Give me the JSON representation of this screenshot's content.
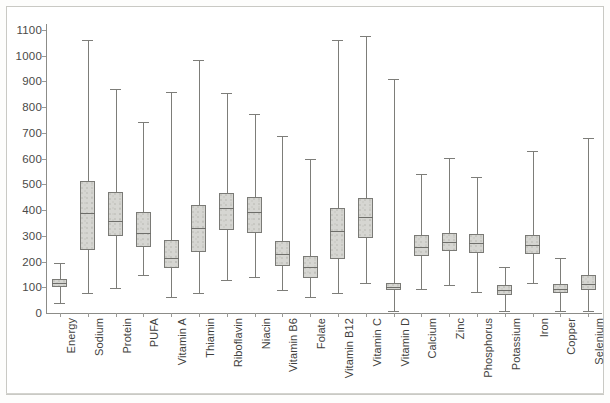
{
  "chart_data": {
    "type": "box",
    "title": "",
    "subtitle": "",
    "xlabel": "",
    "ylabel": "",
    "ylim": [
      0,
      1100
    ],
    "ytick_step": 100,
    "yticks": [
      0,
      100,
      200,
      300,
      400,
      500,
      600,
      700,
      800,
      900,
      1000,
      1100
    ],
    "ytick_labels": [
      "0",
      "100",
      "200",
      "300",
      "400",
      "500",
      "600",
      "700",
      "800",
      "900",
      "1000",
      "1100"
    ],
    "grid": false,
    "legend": null,
    "orientation": "vertical",
    "categories": [
      "Energy",
      "Sodium",
      "Protein",
      "PUFA",
      "Vitamin A",
      "Thiamin",
      "Riboflavin",
      "Niacin",
      "Vitamin B6",
      "Folate",
      "Vitamin B12",
      "Vitamin C",
      "Vitamin D",
      "Calcium",
      "Zinc",
      "Phosphorus",
      "Potassium",
      "Iron",
      "Copper",
      "Selenium"
    ],
    "boxes": [
      {
        "label": "Energy",
        "whisker_low": 40,
        "q1": 100,
        "median": 118,
        "q3": 133,
        "whisker_high": 196
      },
      {
        "label": "Sodium",
        "whisker_low": 78,
        "q1": 245,
        "median": 390,
        "q3": 512,
        "whisker_high": 1062
      },
      {
        "label": "Protein",
        "whisker_low": 98,
        "q1": 300,
        "median": 358,
        "q3": 470,
        "whisker_high": 872
      },
      {
        "label": "PUFA",
        "whisker_low": 148,
        "q1": 258,
        "median": 310,
        "q3": 392,
        "whisker_high": 742
      },
      {
        "label": "Vitamin A",
        "whisker_low": 62,
        "q1": 175,
        "median": 212,
        "q3": 282,
        "whisker_high": 860
      },
      {
        "label": "Thiamin",
        "whisker_low": 78,
        "q1": 238,
        "median": 330,
        "q3": 418,
        "whisker_high": 985
      },
      {
        "label": "Riboflavin",
        "whisker_low": 128,
        "q1": 322,
        "median": 408,
        "q3": 468,
        "whisker_high": 855
      },
      {
        "label": "Niacin",
        "whisker_low": 140,
        "q1": 312,
        "median": 392,
        "q3": 452,
        "whisker_high": 775
      },
      {
        "label": "Vitamin B6",
        "whisker_low": 88,
        "q1": 182,
        "median": 228,
        "q3": 278,
        "whisker_high": 688
      },
      {
        "label": "Folate",
        "whisker_low": 62,
        "q1": 135,
        "median": 178,
        "q3": 222,
        "whisker_high": 598
      },
      {
        "label": "Vitamin B12",
        "whisker_low": 78,
        "q1": 208,
        "median": 318,
        "q3": 408,
        "whisker_high": 1060
      },
      {
        "label": "Vitamin C",
        "whisker_low": 118,
        "q1": 292,
        "median": 372,
        "q3": 448,
        "whisker_high": 1078
      },
      {
        "label": "Vitamin D",
        "whisker_low": 8,
        "q1": 88,
        "median": 100,
        "q3": 115,
        "whisker_high": 910
      },
      {
        "label": "Calcium",
        "whisker_low": 92,
        "q1": 222,
        "median": 258,
        "q3": 302,
        "whisker_high": 540
      },
      {
        "label": "Zinc",
        "whisker_low": 108,
        "q1": 240,
        "median": 275,
        "q3": 312,
        "whisker_high": 602
      },
      {
        "label": "Phosphorus",
        "whisker_low": 82,
        "q1": 235,
        "median": 272,
        "q3": 308,
        "whisker_high": 528
      },
      {
        "label": "Potassium",
        "whisker_low": 8,
        "q1": 70,
        "median": 88,
        "q3": 108,
        "whisker_high": 178
      },
      {
        "label": "Iron",
        "whisker_low": 118,
        "q1": 228,
        "median": 265,
        "q3": 302,
        "whisker_high": 628
      },
      {
        "label": "Copper",
        "whisker_low": 8,
        "q1": 76,
        "median": 92,
        "q3": 112,
        "whisker_high": 212
      },
      {
        "label": "Selenium",
        "whisker_low": 8,
        "q1": 88,
        "median": 112,
        "q3": 148,
        "whisker_high": 682
      }
    ],
    "colors": {
      "box_fill": "#d6d6d2",
      "box_edge": "#7a7a76",
      "median": "#6e6e6a",
      "whisker": "#7d7d79",
      "axis": "#8c8c88",
      "tick_label": "#4a4a48",
      "category_label": "#3f3f3d",
      "plot_background": "#ffffff",
      "frame": "#c9c9c4"
    }
  }
}
